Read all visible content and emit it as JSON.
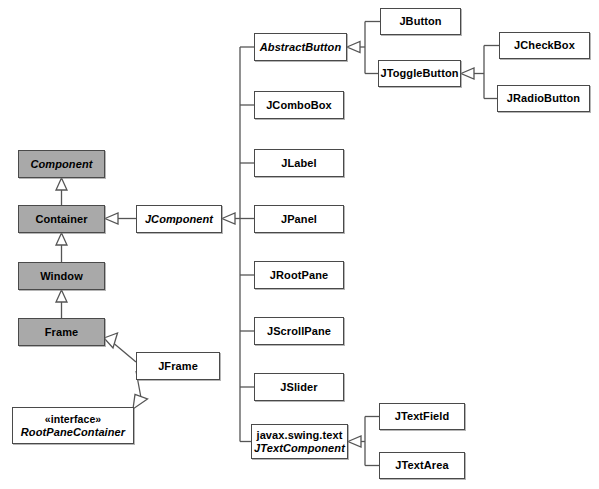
{
  "diagram": {
    "type": "uml-class-diagram",
    "colors": {
      "awt_fill": "#a9a9a9",
      "swing_fill": "#ffffff",
      "border": "#4a4a4a",
      "line": "#555555",
      "background": "#ffffff"
    },
    "nodes": [
      {
        "id": "component",
        "label": "Component",
        "abstract": true,
        "fill": "awt",
        "x": 18,
        "y": 150,
        "w": 87,
        "h": 28
      },
      {
        "id": "container",
        "label": "Container",
        "abstract": false,
        "fill": "awt",
        "x": 18,
        "y": 205,
        "w": 87,
        "h": 28
      },
      {
        "id": "window",
        "label": "Window",
        "abstract": false,
        "fill": "awt",
        "x": 18,
        "y": 262,
        "w": 87,
        "h": 28
      },
      {
        "id": "frame",
        "label": "Frame",
        "abstract": false,
        "fill": "awt",
        "x": 18,
        "y": 318,
        "w": 87,
        "h": 28
      },
      {
        "id": "jframe",
        "label": "JFrame",
        "abstract": false,
        "fill": "swing",
        "x": 136,
        "y": 352,
        "w": 84,
        "h": 28
      },
      {
        "id": "rootpanecontainer",
        "label": "RootPaneContainer",
        "stereotype": "«interface»",
        "abstract": true,
        "fill": "swing",
        "x": 12,
        "y": 407,
        "w": 122,
        "h": 37
      },
      {
        "id": "jcomponent",
        "label": "JComponent",
        "abstract": true,
        "fill": "swing",
        "x": 136,
        "y": 205,
        "w": 86,
        "h": 28
      },
      {
        "id": "abstractbutton",
        "label": "AbstractButton",
        "abstract": true,
        "fill": "swing",
        "x": 254,
        "y": 33,
        "w": 93,
        "h": 28
      },
      {
        "id": "jcombobox",
        "label": "JComboBox",
        "abstract": false,
        "fill": "swing",
        "x": 254,
        "y": 91,
        "w": 90,
        "h": 28
      },
      {
        "id": "jlabel",
        "label": "JLabel",
        "abstract": false,
        "fill": "swing",
        "x": 254,
        "y": 149,
        "w": 90,
        "h": 28
      },
      {
        "id": "jpanel",
        "label": "JPanel",
        "abstract": false,
        "fill": "swing",
        "x": 254,
        "y": 205,
        "w": 90,
        "h": 28
      },
      {
        "id": "jrootpane",
        "label": "JRootPane",
        "abstract": false,
        "fill": "swing",
        "x": 254,
        "y": 261,
        "w": 90,
        "h": 28
      },
      {
        "id": "jscrollpane",
        "label": "JScrollPane",
        "abstract": false,
        "fill": "swing",
        "x": 254,
        "y": 317,
        "w": 90,
        "h": 28
      },
      {
        "id": "jslider",
        "label": "JSlider",
        "abstract": false,
        "fill": "swing",
        "x": 254,
        "y": 373,
        "w": 90,
        "h": 28
      },
      {
        "id": "jtextcomponent",
        "label": "JTextComponent",
        "package": "javax.swing.text",
        "abstract": true,
        "fill": "swing",
        "x": 251,
        "y": 424,
        "w": 97,
        "h": 35
      },
      {
        "id": "jbutton",
        "label": "JButton",
        "abstract": false,
        "fill": "swing",
        "x": 380,
        "y": 8,
        "w": 81,
        "h": 27
      },
      {
        "id": "jtogglebutton",
        "label": "JToggleButton",
        "abstract": false,
        "fill": "swing",
        "x": 378,
        "y": 60,
        "w": 83,
        "h": 27
      },
      {
        "id": "jcheckbox",
        "label": "JCheckBox",
        "abstract": false,
        "fill": "swing",
        "x": 499,
        "y": 32,
        "w": 91,
        "h": 27
      },
      {
        "id": "jradiobutton",
        "label": "JRadioButton",
        "abstract": false,
        "fill": "swing",
        "x": 497,
        "y": 85,
        "w": 93,
        "h": 27
      },
      {
        "id": "jtextfield",
        "label": "JTextField",
        "abstract": false,
        "fill": "swing",
        "x": 379,
        "y": 403,
        "w": 86,
        "h": 27
      },
      {
        "id": "jtextarea",
        "label": "JTextArea",
        "abstract": false,
        "fill": "swing",
        "x": 379,
        "y": 452,
        "w": 86,
        "h": 27
      }
    ],
    "edges": [
      {
        "from": "container",
        "to": "component",
        "kind": "generalization"
      },
      {
        "from": "window",
        "to": "container",
        "kind": "generalization"
      },
      {
        "from": "frame",
        "to": "window",
        "kind": "generalization"
      },
      {
        "from": "jframe",
        "to": "frame",
        "kind": "generalization"
      },
      {
        "from": "jframe",
        "to": "rootpanecontainer",
        "kind": "realization"
      },
      {
        "from": "jcomponent",
        "to": "container",
        "kind": "generalization"
      },
      {
        "from": "abstractbutton",
        "to": "jcomponent",
        "kind": "generalization"
      },
      {
        "from": "jcombobox",
        "to": "jcomponent",
        "kind": "generalization"
      },
      {
        "from": "jlabel",
        "to": "jcomponent",
        "kind": "generalization"
      },
      {
        "from": "jpanel",
        "to": "jcomponent",
        "kind": "generalization"
      },
      {
        "from": "jrootpane",
        "to": "jcomponent",
        "kind": "generalization"
      },
      {
        "from": "jscrollpane",
        "to": "jcomponent",
        "kind": "generalization"
      },
      {
        "from": "jslider",
        "to": "jcomponent",
        "kind": "generalization"
      },
      {
        "from": "jtextcomponent",
        "to": "jcomponent",
        "kind": "generalization"
      },
      {
        "from": "jbutton",
        "to": "abstractbutton",
        "kind": "generalization"
      },
      {
        "from": "jtogglebutton",
        "to": "abstractbutton",
        "kind": "generalization"
      },
      {
        "from": "jcheckbox",
        "to": "jtogglebutton",
        "kind": "generalization"
      },
      {
        "from": "jradiobutton",
        "to": "jtogglebutton",
        "kind": "generalization"
      },
      {
        "from": "jtextfield",
        "to": "jtextcomponent",
        "kind": "generalization"
      },
      {
        "from": "jtextarea",
        "to": "jtextcomponent",
        "kind": "generalization"
      }
    ]
  }
}
